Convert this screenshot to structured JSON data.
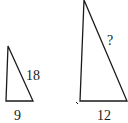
{
  "diagram": {
    "type": "similar-triangles",
    "small_triangle": {
      "hypotenuse_label": "18",
      "base_label": "9"
    },
    "large_triangle": {
      "hypotenuse_label": "?",
      "base_label": "12"
    },
    "colors": {
      "stroke": "#1a1a1a",
      "background": "#ffffff"
    }
  }
}
